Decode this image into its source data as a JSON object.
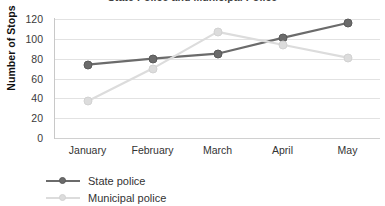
{
  "chart_data": {
    "type": "line",
    "title": "State Police and Municipal Police",
    "xlabel": "",
    "ylabel": "Number of Stops",
    "categories": [
      "January",
      "February",
      "March",
      "April",
      "May"
    ],
    "ylim": [
      0,
      120
    ],
    "yticks": [
      0,
      20,
      40,
      60,
      80,
      100,
      120
    ],
    "ytick_labels": [
      "0",
      "20",
      "40",
      "60",
      "80",
      "100",
      "120"
    ],
    "grid": true,
    "legend_position": "bottom-left",
    "series": [
      {
        "name": "State police",
        "color": "#6B6B6B",
        "values": [
          74,
          80,
          85,
          101,
          116
        ]
      },
      {
        "name": "Municipal police",
        "color": "#DCDCDC",
        "values": [
          37,
          70,
          107,
          94,
          81
        ]
      }
    ]
  }
}
